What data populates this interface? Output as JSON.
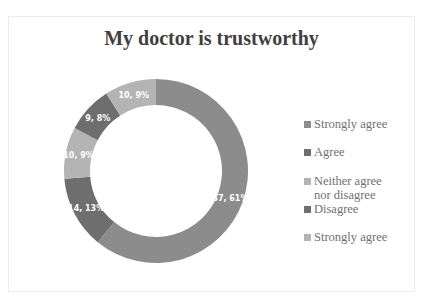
{
  "chart_data": {
    "type": "pie",
    "subtype": "donut",
    "title": "My doctor is trustworthy",
    "categories": [
      "Strongly agree",
      "Agree",
      "Neither agree nor disagree",
      "Disagree",
      "Strongly agree"
    ],
    "values": [
      67,
      14,
      10,
      9,
      10
    ],
    "percentages": [
      61,
      13,
      9,
      8,
      9
    ],
    "data_labels": [
      "67, 61%",
      "14, 13%",
      "10, 9%",
      "9, 8%",
      "10, 9%"
    ],
    "colors": [
      "#8c8c8c",
      "#6e6e6e",
      "#b4b4b4",
      "#6e6e6e",
      "#b4b4b4"
    ],
    "legend_position": "right"
  },
  "legend": {
    "items": [
      {
        "label": "Strongly agree",
        "color": "#8c8c8c"
      },
      {
        "label": "Agree",
        "color": "#6e6e6e"
      },
      {
        "label": "Neither agree nor disagree",
        "color": "#b4b4b4"
      },
      {
        "label": "Disagree",
        "color": "#6e6e6e"
      },
      {
        "label": "Strongly agree",
        "color": "#b4b4b4"
      }
    ]
  }
}
